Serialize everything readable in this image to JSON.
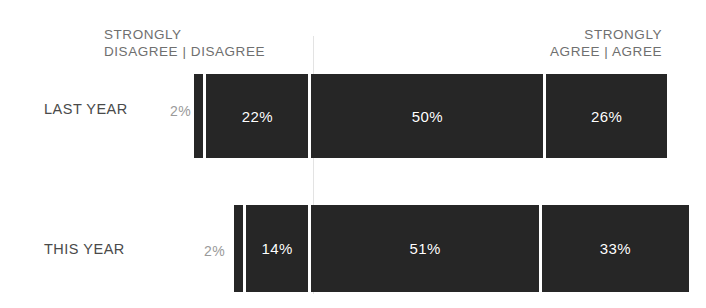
{
  "chart_data": {
    "type": "bar",
    "subtype": "stacked-horizontal-likert",
    "title": "",
    "xlabel": "",
    "ylabel": "",
    "grid": true,
    "legend_position": "top",
    "categories": [
      "LAST YEAR",
      "THIS YEAR"
    ],
    "series": [
      {
        "name": "STRONGLY DISAGREE",
        "values": [
          2,
          2
        ]
      },
      {
        "name": "DISAGREE",
        "values": [
          22,
          14
        ]
      },
      {
        "name": "AGREE",
        "values": [
          50,
          51
        ]
      },
      {
        "name": "STRONGLY AGREE",
        "values": [
          26,
          33
        ]
      }
    ],
    "value_labels": [
      [
        "2%",
        "22%",
        "50%",
        "26%"
      ],
      [
        "2%",
        "14%",
        "51%",
        "33%"
      ]
    ],
    "xlim": [
      0,
      100
    ],
    "units": "percent"
  },
  "headers": {
    "left": "STRONGLY\nDISAGREE  |  DISAGREE",
    "right": "STRONGLY\nAGREE  |  AGREE"
  },
  "rows": [
    {
      "name": "LAST YEAR",
      "outside_value": "2%",
      "segments": [
        {
          "label": "",
          "value": "2%",
          "width_pct": 2
        },
        {
          "label": "",
          "value": "22%",
          "width_pct": 22
        },
        {
          "label": "",
          "value": "50%",
          "width_pct": 50
        },
        {
          "label": "",
          "value": "26%",
          "width_pct": 26
        }
      ]
    },
    {
      "name": "THIS YEAR",
      "outside_value": "2%",
      "segments": [
        {
          "label": "",
          "value": "2%",
          "width_pct": 2
        },
        {
          "label": "",
          "value": "14%",
          "width_pct": 14
        },
        {
          "label": "",
          "value": "51%",
          "width_pct": 51
        },
        {
          "label": "",
          "value": "33%",
          "width_pct": 33
        }
      ]
    }
  ],
  "colors": {
    "bar": "#262626",
    "divider": "#ffffff",
    "bar_label": "#ffffff",
    "outside_label": "#9a9a9a",
    "header_label": "#6f6f6f",
    "row_label": "#4a4a4a",
    "gridline": "#e3e3e3",
    "background": "#ffffff"
  }
}
